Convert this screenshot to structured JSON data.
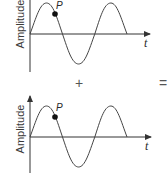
{
  "diagram": {
    "top_graph": {
      "y_axis_label": "Amplitude",
      "x_axis_label": "t",
      "point_label": "P",
      "wave": "sine, 1.5 cycles, starts at origin going up"
    },
    "plus_operator": "+",
    "bottom_graph": {
      "y_axis_label": "Amplitude",
      "x_axis_label": "t",
      "point_label": "P",
      "wave": "sine, 1.5 cycles, starts at origin going up"
    },
    "equals_operator": "=",
    "colors": {
      "line": "#444444",
      "axis": "#333333",
      "point": "#111111",
      "background": "#ffffff"
    }
  }
}
